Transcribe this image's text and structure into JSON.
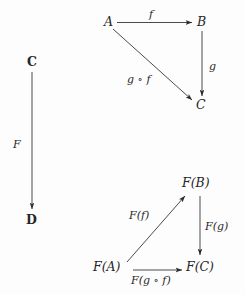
{
  "figure": {
    "kind": "commutative-diagram",
    "background_color": "#fdfdfd",
    "ink_color": "#2b2b2b"
  },
  "source_category": {
    "label": "C",
    "objects": {
      "a": "A",
      "b": "B",
      "c": "C"
    },
    "morphisms": {
      "f": "f",
      "g": "g",
      "gf": "g ∘ f"
    }
  },
  "target_category": {
    "label": "D",
    "objects": {
      "fa": "F(A)",
      "fb": "F(B)",
      "fc": "F(C)"
    },
    "morphisms": {
      "ff": "F(f)",
      "fg": "F(g)",
      "fgf": "F(g ∘ f)"
    }
  },
  "functor": {
    "label": "F"
  }
}
